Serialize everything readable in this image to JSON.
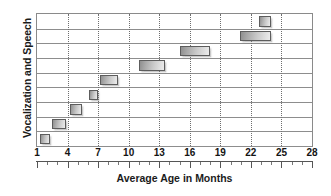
{
  "chart_data": {
    "type": "bar",
    "orientation": "horizontal",
    "title": "",
    "xlabel": "Average Age in Months",
    "ylabel": "Vocalization and Speech",
    "xlim": [
      1,
      28
    ],
    "xticks": [
      1,
      4,
      7,
      10,
      13,
      16,
      19,
      22,
      25,
      28
    ],
    "xtick_labels": [
      "1",
      "4",
      "7",
      "10",
      "13",
      "16",
      "19",
      "22",
      "25",
      "28"
    ],
    "grid": "vertical dotted gridlines at major ticks; horizontal solid row separators",
    "legend": "none",
    "row_count": 9,
    "bars": [
      {
        "row": 1,
        "start": 1.3,
        "end": 2.3
      },
      {
        "row": 2,
        "start": 2.5,
        "end": 3.8
      },
      {
        "row": 3,
        "start": 4.2,
        "end": 5.4
      },
      {
        "row": 4,
        "start": 6.1,
        "end": 7.0
      },
      {
        "row": 5,
        "start": 7.2,
        "end": 9.0
      },
      {
        "row": 6,
        "start": 11.0,
        "end": 13.6
      },
      {
        "row": 7,
        "start": 15.0,
        "end": 18.0
      },
      {
        "row": 8,
        "start": 20.9,
        "end": 24.0
      },
      {
        "row": 9,
        "start": 22.8,
        "end": 24.0
      }
    ],
    "bar_fill_start_color": "#8f8f8f",
    "bar_fill_end_color": "#ededed",
    "bar_border_color": "#5d5d5d",
    "axis_color": "#8a8a8a",
    "text_color": "#1b1b1b"
  },
  "axes": {
    "y_title": "Vocalization and Speech",
    "x_title": "Average Age in Months"
  }
}
